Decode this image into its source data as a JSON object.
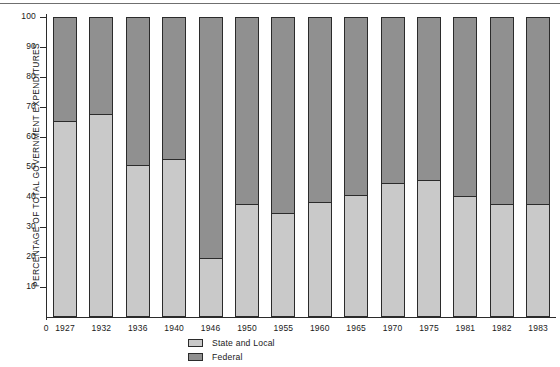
{
  "chart_data": {
    "type": "bar",
    "stacked": true,
    "stacked_to_percent": true,
    "title": "",
    "xlabel": "",
    "ylabel": "PERCENTAGE OF TOTAL GOVERNMENT EXPENDITURES",
    "ylim": [
      0,
      100
    ],
    "yticks": [
      0,
      10,
      20,
      30,
      40,
      50,
      60,
      70,
      80,
      90,
      100
    ],
    "ytick_labels": [
      "0",
      "10",
      "20",
      "30",
      "40",
      "50",
      "60",
      "70",
      "80",
      "90",
      "100"
    ],
    "grid": false,
    "legend_position": "bottom-center",
    "x_zero_label": "0",
    "categories": [
      "1927",
      "1932",
      "1936",
      "1940",
      "1946",
      "1950",
      "1955",
      "1960",
      "1965",
      "1970",
      "1975",
      "1981",
      "1982",
      "1983"
    ],
    "series": [
      {
        "name": "State and Local",
        "color": "#c9c9c9",
        "values": [
          65,
          67.5,
          50.5,
          52.5,
          19.5,
          37.5,
          34.5,
          38,
          40.5,
          44.5,
          45.5,
          40,
          37.5,
          37.5
        ]
      },
      {
        "name": "Federal",
        "color": "#909090",
        "values": [
          35,
          32.5,
          49.5,
          47.5,
          80.5,
          62.5,
          65.5,
          62,
          59.5,
          55.5,
          54.5,
          60,
          62.5,
          62.5
        ]
      }
    ]
  },
  "colors": {
    "state_and_local": "#c9c9c9",
    "federal": "#909090",
    "outline": "#2b2b2b",
    "background": "#ffffff",
    "rule": "#6f6f6f"
  },
  "legend": {
    "items": [
      {
        "label": "State and Local",
        "color": "#c9c9c9"
      },
      {
        "label": "Federal",
        "color": "#909090"
      }
    ]
  }
}
